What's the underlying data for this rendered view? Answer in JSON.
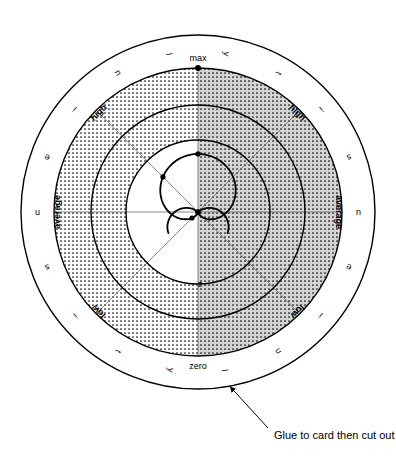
{
  "figure": {
    "center": {
      "x": 198,
      "y": 212
    },
    "radii": {
      "outer_circle": 177,
      "max_circle": 144,
      "band_inner": 107,
      "inner_circle": 72,
      "curve_max": 45
    },
    "colors": {
      "ink": "#000000",
      "paper": "#ffffff",
      "grey_fill": "#d4d4d4",
      "dot_fill": "#000000",
      "spoke": "#555555"
    }
  },
  "axis_labels": {
    "max": "max",
    "zero": "zero",
    "center_mark": "z"
  },
  "band_labels": {
    "high_left": "high",
    "high_right": "high",
    "average_left": "average",
    "average_right": "average",
    "low_left": "low",
    "low_right": "low"
  },
  "ring_letters": {
    "left_arc_top_to_bottom": [
      "l",
      "u",
      "i",
      "e",
      "n",
      "s",
      "i",
      "t",
      "y"
    ],
    "right_arc_top_to_bottom": [
      "y",
      "t",
      "i",
      "s",
      "u",
      "e",
      "i",
      "n",
      "l"
    ]
  },
  "caption": {
    "text": "Glue to card then cut out"
  },
  "chart_data": {
    "type": "line",
    "xlabel": "",
    "ylabel": "",
    "coordinate_system": "polar",
    "grid": true,
    "legend_position": "none",
    "radial_axis": {
      "tick_labels": [
        "zero",
        "low",
        "average",
        "high",
        "max"
      ],
      "tick_radii": [
        0,
        45,
        90,
        135,
        144
      ],
      "range": [
        0,
        144
      ]
    },
    "angular_axis": {
      "spoke_count": 8,
      "spoke_angles_deg": [
        0,
        45,
        90,
        135,
        180,
        225,
        270,
        315
      ]
    },
    "series": [
      {
        "name": "response curve",
        "type": "cardioid",
        "points_deg_radius": [
          [
            90,
            36
          ],
          [
            135,
            40
          ],
          [
            180,
            33
          ],
          [
            225,
            22
          ],
          [
            270,
            0
          ],
          [
            315,
            22
          ],
          [
            0,
            33
          ],
          [
            45,
            40
          ]
        ],
        "marked_nodes_deg": [
          180,
          225,
          315,
          0
        ],
        "marked_node_count": 4
      }
    ],
    "annotations": [
      {
        "text": "max",
        "position": "top"
      },
      {
        "text": "zero",
        "position": "bottom"
      },
      {
        "text": "z",
        "position": "center-bottom"
      },
      {
        "text": "Glue to card then cut out",
        "position": "bottom-right"
      }
    ]
  }
}
